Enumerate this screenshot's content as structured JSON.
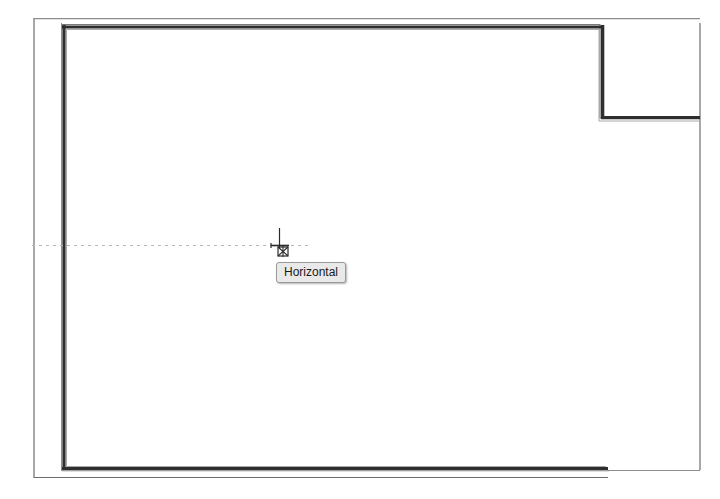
{
  "app": {
    "title": "CAD Drawing Canvas",
    "background_color": "#ffffff"
  },
  "tooltip": {
    "label": "Horizontal",
    "background_color": "#e9e9e9",
    "border_color": "#9a9a9a",
    "text_color": "#1a1a1a",
    "x": 276,
    "y": 262
  },
  "cursor": {
    "name": "crosshair-snap-cursor",
    "x": 280,
    "y": 244,
    "color": "#2b2b2b"
  },
  "drawing": {
    "name": "floor-plan",
    "thin_line_color": "#6e6e6e",
    "thick_wall_color": "#2e2e2e",
    "guide_line_color": "#b6b6b6",
    "outer_outline": {
      "name": "outer-boundary",
      "x": 33,
      "y": 18,
      "width": 667,
      "height": 460
    },
    "inner_wall": {
      "name": "inner-wall-outline",
      "x": 62,
      "y": 25,
      "width": 546,
      "height": 445
    },
    "notch": {
      "name": "top-right-notch",
      "corner_x": 600,
      "corner_y": 23,
      "bottom_y": 118,
      "right_x": 700
    },
    "guide_line": {
      "name": "horizontal-snap-guide",
      "y": 245,
      "x_start": 32,
      "x_end": 312,
      "dash": "3 4"
    }
  }
}
